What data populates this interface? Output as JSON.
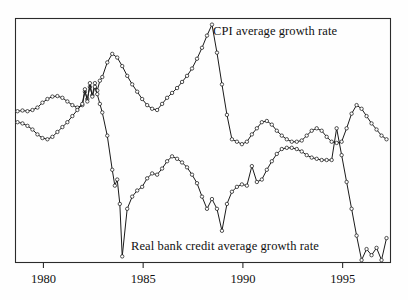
{
  "figure": {
    "background_color": "#fefefe",
    "frame_color": "#2b2b2b",
    "line_color": "#1a1a1a",
    "marker_fill": "#ffffff"
  },
  "labels": {
    "cpi": "CPI average growth rate",
    "credit": "Real bank credit average growth rate"
  },
  "axis": {
    "ticks": [
      "1980",
      "1985",
      "1990",
      "1995"
    ]
  },
  "chart_data": {
    "type": "line",
    "title": "",
    "xlabel": "",
    "ylabel": "",
    "xlim": [
      1978.6,
      1997.4
    ],
    "ylim": [
      0,
      100
    ],
    "grid": false,
    "legend": "inline annotations",
    "xticks": [
      1980,
      1985,
      1990,
      1995
    ],
    "xtick_labels": [
      "1980",
      "1985",
      "1990",
      "1995"
    ],
    "annotations": [
      {
        "text": "CPI average growth rate",
        "x": 1988.6,
        "y": 91
      },
      {
        "text": "Real bank credit average growth rate",
        "x": 1982.0,
        "y": 10
      }
    ],
    "series": [
      {
        "name": "CPI average growth rate",
        "marker": "open-circle",
        "x": [
          1978.7,
          1978.95,
          1979.2,
          1979.45,
          1979.7,
          1979.95,
          1980.2,
          1980.45,
          1980.7,
          1980.95,
          1981.2,
          1981.45,
          1981.7,
          1981.95,
          1982.08,
          1982.2,
          1982.33,
          1982.45,
          1982.58,
          1982.7,
          1982.83,
          1982.95,
          1983.2,
          1983.45,
          1983.7,
          1983.95,
          1984.2,
          1984.45,
          1984.7,
          1984.95,
          1985.2,
          1985.45,
          1985.7,
          1985.95,
          1986.2,
          1986.45,
          1986.7,
          1986.95,
          1987.2,
          1987.45,
          1987.7,
          1987.95,
          1988.2,
          1988.45,
          1988.7,
          1988.95,
          1989.2,
          1989.45,
          1989.7,
          1989.95,
          1990.2,
          1990.45,
          1990.7,
          1990.95,
          1991.2,
          1991.45,
          1991.7,
          1991.95,
          1992.2,
          1992.45,
          1992.7,
          1992.95,
          1993.2,
          1993.45,
          1993.7,
          1993.95,
          1994.2,
          1994.45,
          1994.7,
          1994.95,
          1995.2,
          1995.45,
          1995.7,
          1995.95,
          1996.2,
          1996.45,
          1996.7,
          1996.95,
          1997.2
        ],
        "y": [
          62.0,
          62.3,
          62.0,
          62.5,
          63.5,
          65.5,
          67.0,
          68.0,
          68.2,
          67.5,
          66.0,
          64.5,
          63.5,
          64.5,
          70.0,
          67.0,
          72.0,
          68.5,
          73.5,
          70.5,
          74.5,
          76.0,
          82.0,
          85.5,
          84.0,
          80.5,
          76.5,
          73.0,
          70.0,
          67.0,
          64.5,
          63.0,
          62.5,
          65.0,
          67.5,
          69.5,
          71.5,
          74.0,
          76.5,
          79.5,
          83.5,
          88.0,
          93.0,
          97.5,
          86.0,
          73.0,
          60.5,
          50.5,
          49.5,
          48.5,
          49.5,
          52.5,
          55.0,
          57.5,
          58.0,
          56.5,
          54.0,
          52.0,
          50.5,
          49.5,
          49.5,
          50.0,
          52.0,
          54.0,
          55.0,
          54.0,
          51.5,
          49.5,
          49.0,
          49.5,
          55.0,
          61.0,
          64.5,
          63.0,
          60.0,
          57.0,
          54.5,
          52.0,
          50.5
        ]
      },
      {
        "name": "Real bank credit average growth rate",
        "marker": "open-circle",
        "x": [
          1978.7,
          1978.95,
          1979.2,
          1979.45,
          1979.7,
          1979.95,
          1980.2,
          1980.45,
          1980.7,
          1980.95,
          1981.2,
          1981.45,
          1981.7,
          1981.95,
          1982.08,
          1982.2,
          1982.33,
          1982.45,
          1982.58,
          1982.7,
          1982.83,
          1982.95,
          1983.2,
          1983.45,
          1983.58,
          1983.7,
          1983.83,
          1983.95,
          1984.2,
          1984.45,
          1984.7,
          1984.95,
          1985.2,
          1985.45,
          1985.7,
          1985.95,
          1986.2,
          1986.45,
          1986.7,
          1986.95,
          1987.2,
          1987.45,
          1987.7,
          1987.95,
          1988.2,
          1988.45,
          1988.7,
          1988.95,
          1989.2,
          1989.45,
          1989.7,
          1989.95,
          1990.2,
          1990.45,
          1990.7,
          1990.95,
          1991.2,
          1991.45,
          1991.7,
          1991.95,
          1992.2,
          1992.45,
          1992.7,
          1992.95,
          1993.2,
          1993.45,
          1993.7,
          1993.95,
          1994.2,
          1994.45,
          1994.7,
          1994.95,
          1995.2,
          1995.45,
          1995.7,
          1995.95,
          1996.2,
          1996.45,
          1996.7,
          1996.95,
          1997.2
        ],
        "y": [
          57.5,
          57.0,
          56.0,
          54.5,
          52.5,
          51.0,
          50.5,
          51.5,
          53.5,
          55.5,
          57.5,
          60.0,
          62.5,
          65.0,
          71.0,
          66.0,
          73.5,
          68.0,
          72.0,
          69.0,
          65.0,
          61.5,
          52.0,
          38.0,
          31.5,
          34.0,
          24.0,
          2.5,
          22.0,
          27.0,
          29.5,
          31.0,
          34.5,
          36.5,
          36.0,
          38.5,
          41.5,
          43.5,
          42.5,
          41.0,
          39.0,
          36.0,
          32.5,
          27.0,
          22.0,
          26.0,
          22.0,
          13.0,
          24.0,
          29.0,
          31.0,
          32.0,
          31.5,
          39.5,
          33.0,
          34.0,
          38.0,
          41.5,
          44.5,
          46.5,
          47.0,
          47.0,
          46.5,
          45.5,
          44.0,
          43.0,
          42.5,
          42.0,
          42.0,
          42.0,
          55.0,
          44.0,
          33.0,
          22.0,
          11.0,
          1.0,
          5.5,
          3.0,
          6.0,
          1.0,
          10.0
        ]
      }
    ]
  }
}
